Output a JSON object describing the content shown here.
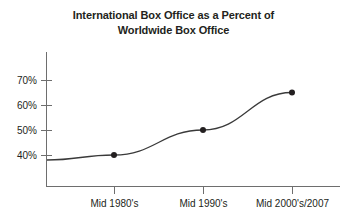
{
  "chart_data": {
    "type": "line",
    "title": "International Box Office as a Percent of Worldwide Box Office",
    "title_lines": [
      "International Box Office as a Percent of",
      "Worldwide Box Office"
    ],
    "categories": [
      "Mid 1980's",
      "Mid 1990's",
      "Mid 2000's/2007"
    ],
    "values": [
      40,
      50,
      65
    ],
    "series": [
      {
        "name": "International Box Office Share",
        "values": [
          40,
          50,
          65
        ]
      }
    ],
    "xlabel": "",
    "ylabel": "",
    "ylim": [
      30,
      75
    ],
    "yticks": [
      40,
      50,
      60,
      70
    ],
    "ytick_labels": [
      "40%",
      "50%",
      "60%",
      "70%"
    ],
    "xtick_labels": [
      "Mid 1980's",
      "Mid 1990's",
      "Mid 2000's/2007"
    ],
    "grid": false,
    "legend": false,
    "legend_position": "none",
    "markers": true,
    "curve_start_value": 38,
    "annotations": [],
    "colors": {
      "line": "#3a3a3a",
      "marker": "#231f20",
      "axis": "#6e6e6e",
      "text": "#231f20",
      "background": "#ffffff"
    }
  }
}
